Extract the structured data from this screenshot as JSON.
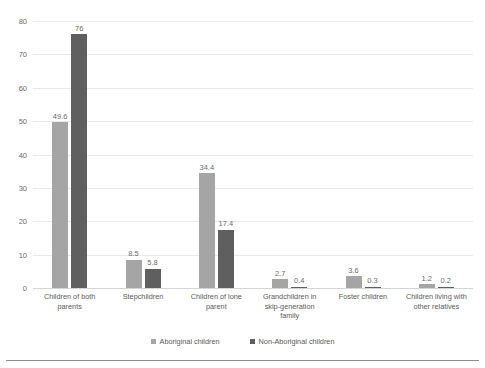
{
  "chart_data": {
    "type": "bar",
    "title": "",
    "subtitle": "",
    "xlabel": "",
    "ylabel": "",
    "ylim": [
      0,
      80
    ],
    "yticks": [
      0,
      10,
      20,
      30,
      40,
      50,
      60,
      70,
      80
    ],
    "grid": true,
    "legend_position": "bottom",
    "categories": [
      "Children of both parents",
      "Stepchildren",
      "Children of lone parent",
      "Grandchildren in skip-generation family",
      "Foster children",
      "Children living with other relatives"
    ],
    "category_lines": [
      [
        "Children of both",
        "parents"
      ],
      [
        "Stepchildren"
      ],
      [
        "Children of lone",
        "parent"
      ],
      [
        "Grandchildren in",
        "skip-generation",
        "family"
      ],
      [
        "Foster children"
      ],
      [
        "Children living with",
        "other relatives"
      ]
    ],
    "series": [
      {
        "name": "Aboriginal children",
        "color": "#a5a5a5",
        "values": [
          49.6,
          8.5,
          34.4,
          2.7,
          3.6,
          1.2
        ],
        "labels": [
          "49.6",
          "8.5",
          "34.4",
          "2.7",
          "3.6",
          "1.2"
        ]
      },
      {
        "name": "Non-Aboriginal children",
        "color": "#5f5f5f",
        "values": [
          76,
          5.8,
          17.4,
          0.4,
          0.3,
          0.2
        ],
        "labels": [
          "76",
          "5.8",
          "17.4",
          "0.4",
          "0.3",
          "0.2"
        ]
      }
    ]
  },
  "axis": {
    "tick_labels": [
      "80",
      "70",
      "60",
      "50",
      "40",
      "30",
      "20",
      "10",
      "0"
    ]
  },
  "colors": {
    "series_1": "#a5a5a5",
    "series_2": "#5f5f5f",
    "gridline": "#e9e9e9",
    "text": "#5a5a5a",
    "rule": "#8d8d8d",
    "background": "#ffffff"
  }
}
